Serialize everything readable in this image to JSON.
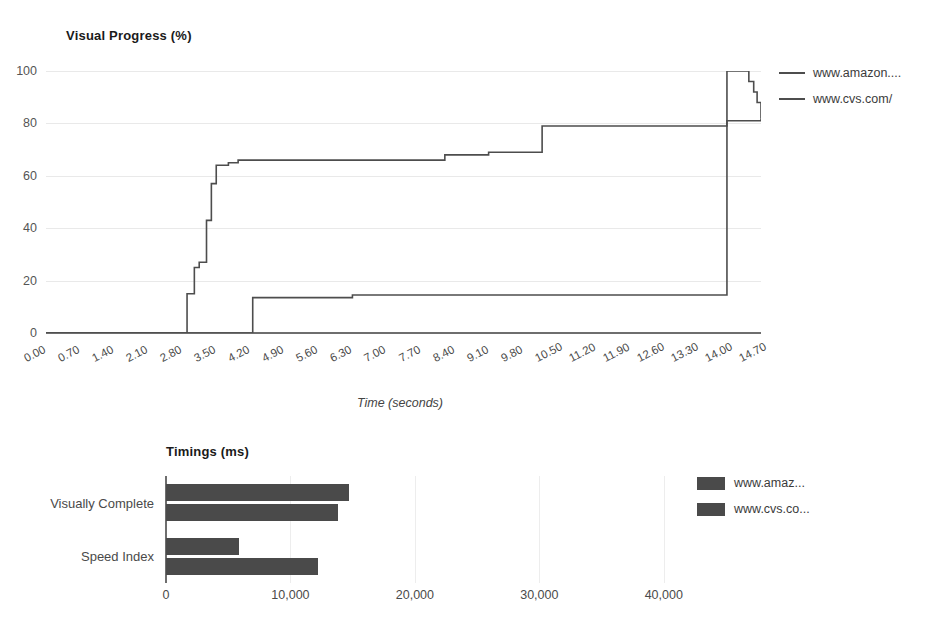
{
  "chart_data": [
    {
      "type": "line",
      "title": "Visual Progress (%)",
      "xlabel": "Time (seconds)",
      "ylabel": "",
      "xlim": [
        0,
        14.7
      ],
      "ylim": [
        0,
        100
      ],
      "grid": true,
      "legend_position": "right",
      "step": "post",
      "xticks": [
        "0.00",
        "0.70",
        "1.40",
        "2.10",
        "2.80",
        "3.50",
        "4.20",
        "4.90",
        "5.60",
        "6.30",
        "7.00",
        "7.70",
        "8.40",
        "9.10",
        "9.80",
        "10.50",
        "11.20",
        "11.90",
        "12.60",
        "13.30",
        "14.00",
        "14.70"
      ],
      "yticks": [
        "0",
        "20",
        "40",
        "60",
        "80",
        "100"
      ],
      "series": [
        {
          "name": "www.amazon....",
          "color": "#4d4d4d",
          "x": [
            0.0,
            2.8,
            2.9,
            3.05,
            3.15,
            3.3,
            3.4,
            3.5,
            3.75,
            3.95,
            4.2,
            8.2,
            9.1,
            10.2,
            14.0,
            14.7
          ],
          "y": [
            0,
            0,
            15,
            25,
            27,
            43,
            57,
            64,
            65,
            66,
            66,
            68,
            69,
            79,
            81,
            82
          ]
        },
        {
          "name": "www.cvs.com/",
          "color": "#4d4d4d",
          "x": [
            0.0,
            4.2,
            4.25,
            6.3,
            13.95,
            14.0,
            14.35,
            14.45,
            14.55,
            14.62,
            14.7
          ],
          "y": [
            0,
            0,
            13.5,
            14.5,
            14.5,
            100,
            100,
            96,
            92,
            88,
            82
          ]
        }
      ],
      "series_end_markers": {
        "amazon_final_jump_x": 14.0,
        "amazon_final_value": 100,
        "cvs_final_value": 100
      }
    },
    {
      "type": "bar",
      "orientation": "horizontal",
      "title": "Timings (ms)",
      "xlabel": "",
      "ylabel": "",
      "xlim": [
        0,
        45000
      ],
      "grid": true,
      "legend_position": "right",
      "categories": [
        "Visually Complete",
        "Speed Index"
      ],
      "xticks": [
        "0",
        "10,000",
        "20,000",
        "30,000",
        "40,000"
      ],
      "xtick_values": [
        0,
        10000,
        20000,
        30000,
        40000
      ],
      "series": [
        {
          "name": "www.amaz...",
          "color": "#4a4a4a",
          "values": [
            14700,
            5900
          ]
        },
        {
          "name": "www.cvs.co...",
          "color": "#4a4a4a",
          "values": [
            13800,
            12200
          ]
        }
      ]
    }
  ],
  "line_chart": {
    "title": "Visual Progress (%)",
    "axis_title": "Time (seconds)",
    "legend": [
      {
        "label": "www.amazon...."
      },
      {
        "label": "www.cvs.com/"
      }
    ]
  },
  "bar_chart": {
    "title": "Timings (ms)",
    "legend": [
      {
        "label": "www.amaz..."
      },
      {
        "label": "www.cvs.co..."
      }
    ]
  }
}
